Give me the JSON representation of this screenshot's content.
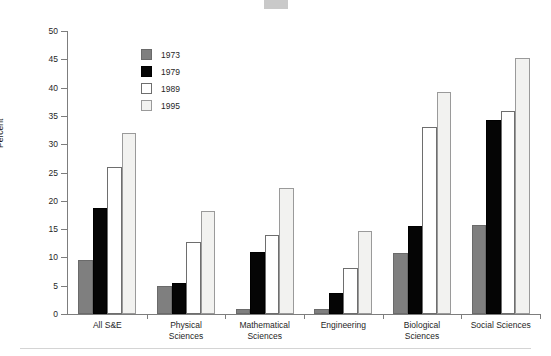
{
  "chart_data": {
    "type": "bar",
    "title": "",
    "xlabel": "",
    "ylabel": "Percent",
    "ylim": [
      0,
      50
    ],
    "ytick_values": [
      0,
      5,
      10,
      15,
      20,
      25,
      30,
      35,
      40,
      45,
      50
    ],
    "ytick_labels": [
      "0",
      "5",
      "10",
      "15",
      "20",
      "25",
      "30",
      "35",
      "40",
      "45",
      "50"
    ],
    "grid": false,
    "legend_position": "upper-left-inside",
    "categories": [
      "All S&E",
      "Physical Sciences",
      "Mathematical Sciences",
      "Engineering",
      "Biological Sciences",
      "Social Sciences"
    ],
    "category_label_lines": [
      [
        "All S&E"
      ],
      [
        "Physical",
        "Sciences"
      ],
      [
        "Mathematical",
        "Sciences"
      ],
      [
        "Engineering"
      ],
      [
        "Biological",
        "Sciences"
      ],
      [
        "Social Sciences"
      ]
    ],
    "series": [
      {
        "name": "1973",
        "color": "#7f7f7f",
        "values": [
          9.5,
          5.0,
          0.9,
          0.8,
          10.7,
          15.8
        ]
      },
      {
        "name": "1979",
        "color": "#050505",
        "values": [
          18.8,
          5.5,
          11.0,
          3.7,
          15.6,
          34.3
        ]
      },
      {
        "name": "1989",
        "color": "#ffffff",
        "values": [
          25.9,
          12.8,
          14.0,
          8.2,
          33.0,
          35.8
        ]
      },
      {
        "name": "1995",
        "color": "#f2f2f0",
        "values": [
          32.0,
          18.2,
          22.2,
          14.6,
          39.2,
          45.3
        ]
      }
    ]
  },
  "legend": {
    "entries": [
      {
        "label": "1973"
      },
      {
        "label": "1979"
      },
      {
        "label": "1989"
      },
      {
        "label": "1995"
      }
    ]
  }
}
